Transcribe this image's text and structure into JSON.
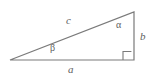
{
  "figure": {
    "name": "right-triangle-labeled",
    "background_color": "#ffffff",
    "stroke_color": "#7a7a7a",
    "label_color": "#5e5e5e",
    "stroke_width": 1.2,
    "vertices": {
      "left": {
        "x": 10,
        "y": 60
      },
      "bottom_right": {
        "x": 134,
        "y": 60
      },
      "top_right": {
        "x": 134,
        "y": 12
      }
    },
    "sides": [
      {
        "id": "hypotenuse",
        "label": "c",
        "from": "left",
        "to": "top_right"
      },
      {
        "id": "base",
        "label": "a",
        "from": "left",
        "to": "bottom_right"
      },
      {
        "id": "vertical",
        "label": "b",
        "from": "bottom_right",
        "to": "top_right"
      }
    ],
    "angles": [
      {
        "id": "alpha",
        "label": "α",
        "at": "top_right"
      },
      {
        "id": "beta",
        "label": "β",
        "at": "left"
      },
      {
        "id": "right-angle",
        "label": "",
        "at": "bottom_right",
        "marker": "square"
      }
    ],
    "right_angle_marker": {
      "x": 123,
      "y": 51,
      "size": 8
    }
  }
}
